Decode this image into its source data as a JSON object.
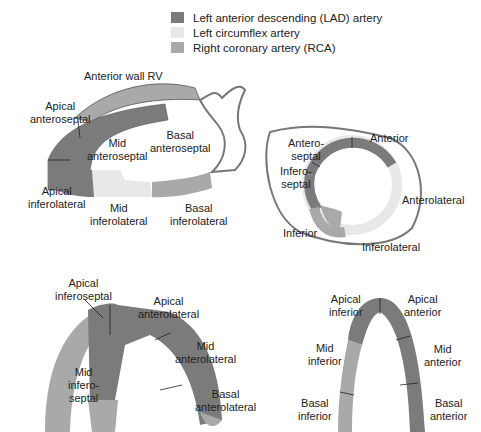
{
  "colors": {
    "lad": "#7b7b7b",
    "lcx": "#e8e8e8",
    "rca": "#a9a9a9",
    "outline": "#555555"
  },
  "legend": [
    {
      "label": "Left anterior descending (LAD) artery",
      "color": "#7b7b7b"
    },
    {
      "label": "Left circumflex artery",
      "color": "#e8e8e8"
    },
    {
      "label": "Right coronary artery (RCA)",
      "color": "#a9a9a9"
    }
  ],
  "views": {
    "long_axis": {
      "labels": {
        "anterior_wall_rv": "Anterior wall RV",
        "apical_anteroseptal": "Apical\nanteroseptal",
        "basal_anteroseptal": "Basal\nanteroseptal",
        "mid_anteroseptal": "Mid\nanteroseptal",
        "apical_inferolateral": "Apical\ninferolateral",
        "mid_inferolateral": "Mid\ninferolateral",
        "basal_inferolateral": "Basal\ninferolateral"
      }
    },
    "short_axis": {
      "labels": {
        "anterior": "Anterior",
        "anteroseptal": "Antero-\nseptal",
        "inferoseptal": "Infero-\nseptal",
        "anterolateral": "Anterolateral",
        "inferior": "Inferior",
        "inferolateral": "Inferolateral"
      }
    },
    "four_chamber": {
      "labels": {
        "apical_inferoseptal": "Apical\ninferoseptal",
        "apical_anterolateral": "Apical\nanterolateral",
        "mid_anterolateral": "Mid\nanterolateral",
        "mid_inferoseptal": "Mid\ninfero-\nseptal",
        "basal_anterolateral": "Basal\nanterolateral"
      }
    },
    "two_chamber": {
      "labels": {
        "apical_inferior": "Apical\ninferior",
        "apical_anterior": "Apical\nanterior",
        "mid_inferior": "Mid\ninferior",
        "mid_anterior": "Mid\nanterior",
        "basal_inferior": "Basal\ninferior",
        "basal_anterior": "Basal\nanterior"
      }
    }
  }
}
